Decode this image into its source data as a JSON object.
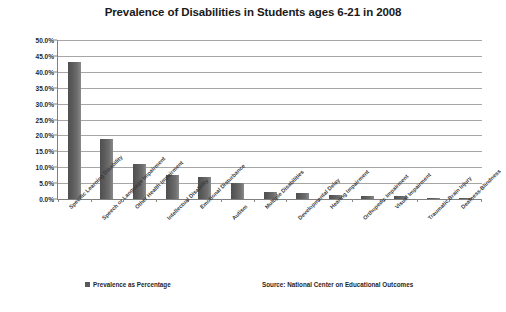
{
  "chart_data": {
    "type": "bar",
    "title": "Prevalence of Disabilities in Students ages 6-21 in 2008",
    "xlabel": "",
    "ylabel": "",
    "ylim": [
      0,
      50
    ],
    "grid": true,
    "legend_position": "bottom-left",
    "categories": [
      "Specific Learning Disability",
      "Speech or Language Impairment",
      "Other Health Impairment",
      "Intellectual Disability",
      "Emotional Disturbance",
      "Autism",
      "Multiple Disabilities",
      "Developmental Delay",
      "Hearing Impairment",
      "Orthopedic Impairment",
      "Visual Impairment",
      "Traumatic Brain Injury",
      "Deafness-Blindness"
    ],
    "series": [
      {
        "name": "Prevalence as Percentage",
        "color": "#595959",
        "values": [
          43.0,
          19.0,
          11.0,
          7.7,
          6.8,
          5.0,
          2.1,
          2.0,
          1.2,
          1.0,
          0.9,
          0.4,
          0.1
        ]
      }
    ],
    "y_ticks": [
      "0.0%",
      "5.0%",
      "10.0%",
      "15.0%",
      "20.0%",
      "25.0%",
      "30.0%",
      "35.0%",
      "40.0%",
      "45.0%",
      "50.0%"
    ],
    "y_tick_values": [
      0,
      5,
      10,
      15,
      20,
      25,
      30,
      35,
      40,
      45,
      50
    ],
    "source": "Source: National Center on Educational Outcomes"
  },
  "legend": {
    "label": "Prevalence as Percentage"
  }
}
